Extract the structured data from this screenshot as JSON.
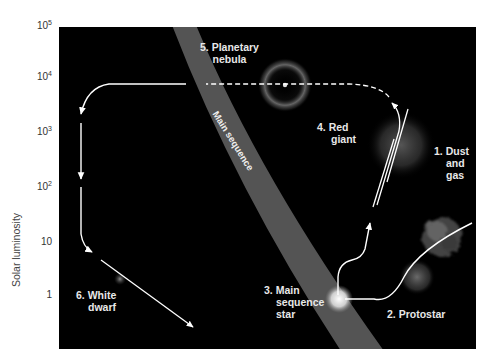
{
  "diagram": {
    "type": "stellar-life-cycle-hr-diagram",
    "y_axis": {
      "title": "Solar luminosity",
      "ticks": [
        {
          "base": "10",
          "exp": "5"
        },
        {
          "base": "10",
          "exp": "4"
        },
        {
          "base": "10",
          "exp": "3"
        },
        {
          "base": "10",
          "exp": "2"
        },
        {
          "base": "10",
          "exp": ""
        },
        {
          "base": "1",
          "exp": ""
        }
      ]
    },
    "band_label": "Main sequence",
    "stages": [
      {
        "id": 1,
        "label_line1": "1. Dust",
        "label_line2": "and",
        "label_line3": "gas"
      },
      {
        "id": 2,
        "label_line1": "2. Protostar"
      },
      {
        "id": 3,
        "label_line1": "3. Main",
        "label_line2": "sequence",
        "label_line3": "star"
      },
      {
        "id": 4,
        "label_line1": "4. Red",
        "label_line2": "giant"
      },
      {
        "id": 5,
        "label_line1": "5. Planetary",
        "label_line2": "nebula"
      },
      {
        "id": 6,
        "label_line1": "6. White",
        "label_line2": "dwarf"
      }
    ],
    "colors": {
      "panel_bg": "#000000",
      "band": "#5a5a5a",
      "path": "#ffffff",
      "label": "#e8e8e8"
    }
  }
}
